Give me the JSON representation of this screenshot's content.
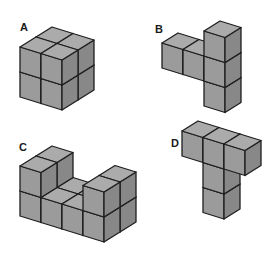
{
  "diagram": {
    "title": "",
    "colors": {
      "top": "#ababab",
      "front": "#9b9b9b",
      "right": "#888888",
      "edge": "#1e1e1e",
      "background": "#ffffff"
    },
    "projection": {
      "x_vec": [
        21,
        6.5
      ],
      "depth_vec": [
        16,
        -10
      ],
      "height": 25
    },
    "figures": [
      {
        "label": "A",
        "label_pos": [
          20,
          22
        ],
        "origin": [
          20,
          97
        ],
        "cubes": [
          [
            0,
            0,
            0
          ],
          [
            1,
            0,
            0
          ],
          [
            0,
            1,
            0
          ],
          [
            1,
            1,
            0
          ],
          [
            0,
            0,
            1
          ],
          [
            1,
            0,
            1
          ],
          [
            0,
            1,
            1
          ],
          [
            1,
            1,
            1
          ]
        ]
      },
      {
        "label": "B",
        "label_pos": [
          155,
          24
        ],
        "origin": [
          162,
          93
        ],
        "cubes": [
          [
            2,
            0,
            0
          ],
          [
            0,
            0,
            1
          ],
          [
            1,
            0,
            1
          ],
          [
            2,
            0,
            1
          ],
          [
            2,
            0,
            2
          ]
        ]
      },
      {
        "label": "C",
        "label_pos": [
          19,
          142
        ],
        "origin": [
          20,
          216
        ],
        "cubes": [
          [
            0,
            0,
            0
          ],
          [
            1,
            0,
            0
          ],
          [
            2,
            0,
            0
          ],
          [
            3,
            0,
            0
          ],
          [
            0,
            1,
            0
          ],
          [
            1,
            1,
            0
          ],
          [
            2,
            1,
            0
          ],
          [
            3,
            1,
            0
          ],
          [
            0,
            0,
            1
          ],
          [
            0,
            1,
            1
          ],
          [
            3,
            0,
            1
          ],
          [
            3,
            1,
            1
          ]
        ]
      },
      {
        "label": "D",
        "label_pos": [
          171,
          138
        ],
        "origin": [
          182,
          206
        ],
        "cubes": [
          [
            1,
            0,
            0
          ],
          [
            1,
            0,
            1
          ],
          [
            0,
            0,
            2
          ],
          [
            1,
            0,
            2
          ],
          [
            2,
            0,
            2
          ]
        ]
      }
    ]
  }
}
